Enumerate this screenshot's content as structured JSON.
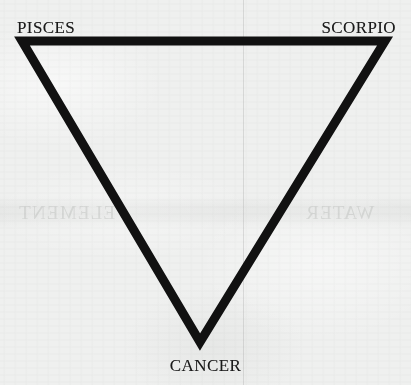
{
  "figure": {
    "kind": "zodiac-elemental-triangle",
    "orientation": "inverted",
    "background_color": "#eff0ef",
    "stroke_color": "#111111",
    "text_color": "#1a1a1a",
    "stroke_width_px": 9
  },
  "labels": {
    "top_left": "PISCES",
    "top_right": "SCORPIO",
    "bottom": "CANCER"
  },
  "vertices": {
    "top_left": {
      "x": 22,
      "y": 41
    },
    "top_right": {
      "x": 385,
      "y": 41
    },
    "bottom": {
      "x": 200,
      "y": 342
    }
  },
  "artifacts": {
    "fold_line_x": 243,
    "ghost_band_top": 196,
    "ghost_band_height": 32,
    "ghost_text_left": "ELEMENT",
    "ghost_text_right": "WATER"
  }
}
